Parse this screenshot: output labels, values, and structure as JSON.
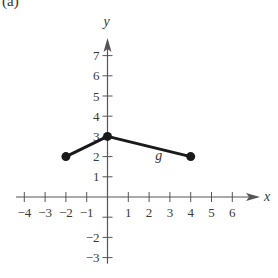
{
  "panel_label": "(a)",
  "chart_data": {
    "type": "line",
    "title": "",
    "xlabel": "x",
    "ylabel": "y",
    "xlim": [
      -4,
      6
    ],
    "ylim": [
      -3,
      7
    ],
    "grid": false,
    "x_ticks": [
      -4,
      -3,
      -2,
      -1,
      1,
      2,
      3,
      4,
      5,
      6
    ],
    "y_ticks": [
      -3,
      -2,
      1,
      2,
      3,
      4,
      5,
      6,
      7
    ],
    "series": [
      {
        "name": "g",
        "points": [
          [
            -2,
            2
          ],
          [
            0,
            3
          ],
          [
            4,
            2
          ]
        ],
        "endpoints_closed": true,
        "color": "#1a1a1a"
      }
    ],
    "annotations": [
      {
        "text": "g",
        "x": 2.3,
        "y": 1.85
      }
    ]
  },
  "colors": {
    "axis": "#555555",
    "curve": "#1a1a1a",
    "text": "#3a3a3a"
  }
}
